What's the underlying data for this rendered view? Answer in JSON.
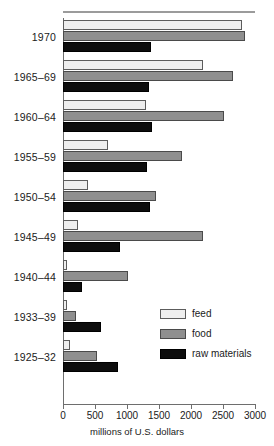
{
  "chart_data": {
    "type": "bar",
    "orientation": "horizontal",
    "title": "",
    "xlabel": "millions of U.S. dollars",
    "ylabel": "",
    "xlim": [
      0,
      3000
    ],
    "xticks": [
      0,
      500,
      1000,
      1500,
      2000,
      2500,
      3000
    ],
    "xtick_labels": [
      "0",
      "500",
      "1000",
      "1500",
      "2000",
      "2500",
      "3000"
    ],
    "grid": false,
    "legend_position": "center-right",
    "categories": [
      "1970",
      "1965–69",
      "1960–64",
      "1955–59",
      "1950–54",
      "1945–49",
      "1940–44",
      "1933–39",
      "1925–32"
    ],
    "series": [
      {
        "name": "feed",
        "color": "#eeeeee",
        "values": [
          2800,
          2180,
          1300,
          700,
          390,
          230,
          70,
          70,
          110
        ]
      },
      {
        "name": "food",
        "color": "#8f8f8f",
        "values": [
          2850,
          2660,
          2520,
          1860,
          1460,
          2190,
          1010,
          210,
          530
        ]
      },
      {
        "name": "raw materials",
        "color": "#0d0d0d",
        "values": [
          1380,
          1350,
          1390,
          1310,
          1360,
          890,
          300,
          590,
          860
        ]
      }
    ]
  },
  "legend": {
    "items": [
      {
        "label": "feed",
        "key": "feed"
      },
      {
        "label": "food",
        "key": "food"
      },
      {
        "label": "raw materials",
        "key": "raw"
      }
    ]
  }
}
